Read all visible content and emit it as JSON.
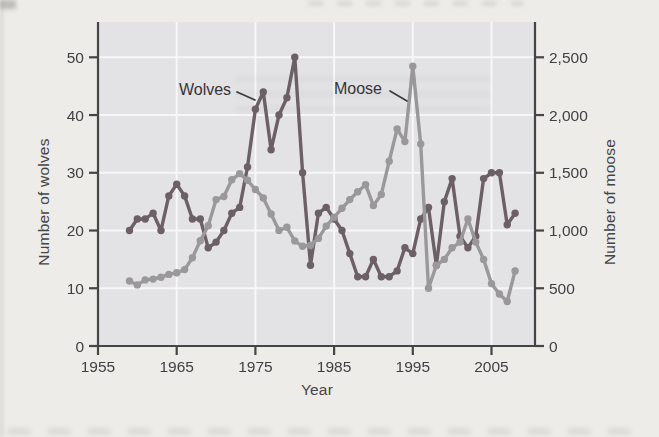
{
  "figure": {
    "page_background": "#edece9",
    "plot_background": "#e3e2e4",
    "grid_color": "#f7f7f9",
    "axis_color": "#454446",
    "text_color": "#403f41",
    "wolves_color": "#6c6065",
    "moose_color": "#9a989a"
  },
  "chart_data": {
    "type": "line",
    "title": "",
    "xlabel": "Year",
    "ylabel_left": "Number of wolves",
    "ylabel_right": "Number of moose",
    "x_ticks": [
      1955,
      1965,
      1975,
      1985,
      1995,
      2005
    ],
    "left_ticks": [
      0,
      10,
      20,
      30,
      40,
      50
    ],
    "right_ticks": [
      "0",
      "500",
      "1,000",
      "1,500",
      "2,000",
      "2,500"
    ],
    "right_tick_values": [
      0,
      500,
      1000,
      1500,
      2000,
      2500
    ],
    "xlim": [
      1955,
      2010.5
    ],
    "ylim_left": [
      0,
      50
    ],
    "ylim_right": [
      0,
      2500
    ],
    "grid": true,
    "legend": "inline-labels",
    "x": [
      1959,
      1960,
      1961,
      1962,
      1963,
      1964,
      1965,
      1966,
      1967,
      1968,
      1969,
      1970,
      1971,
      1972,
      1973,
      1974,
      1975,
      1976,
      1977,
      1978,
      1979,
      1980,
      1981,
      1982,
      1983,
      1984,
      1985,
      1986,
      1987,
      1988,
      1989,
      1990,
      1991,
      1992,
      1993,
      1994,
      1995,
      1996,
      1997,
      1998,
      1999,
      2000,
      2001,
      2002,
      2003,
      2004,
      2005,
      2006,
      2007,
      2008
    ],
    "series": [
      {
        "name": "Wolves",
        "axis": "left",
        "color": "#6c6065",
        "values": [
          20,
          22,
          22,
          23,
          20,
          26,
          28,
          26,
          22,
          22,
          17,
          18,
          20,
          23,
          24,
          31,
          41,
          44,
          34,
          40,
          43,
          50,
          30,
          14,
          23,
          24,
          22,
          20,
          16,
          12,
          12,
          15,
          12,
          12,
          13,
          17,
          16,
          22,
          24,
          14,
          25,
          29,
          19,
          17,
          19,
          29,
          30,
          30,
          21,
          23
        ]
      },
      {
        "name": "Moose",
        "axis": "right",
        "color": "#9a989a",
        "values": [
          563,
          529,
          572,
          579,
          596,
          620,
          634,
          662,
          765,
          912,
          1042,
          1268,
          1295,
          1439,
          1493,
          1435,
          1355,
          1282,
          1143,
          1001,
          1028,
          910,
          863,
          872,
          932,
          1038,
          1115,
          1192,
          1268,
          1335,
          1397,
          1216,
          1313,
          1600,
          1880,
          1770,
          2422,
          1750,
          500,
          699,
          750,
          850,
          900,
          1100,
          900,
          750,
          540,
          450,
          385,
          650
        ]
      }
    ]
  }
}
